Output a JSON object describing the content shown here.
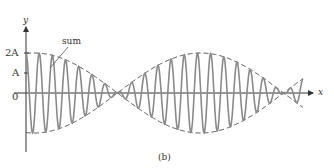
{
  "figure": {
    "caption": "(b)",
    "axis_labels": {
      "y": "y",
      "x": "x"
    },
    "tick_labels": {
      "two_a": "2A",
      "a": "A",
      "zero": "0"
    },
    "annotation": "sum",
    "colors": {
      "wave": "#8a8a8a",
      "envelope": "#444444",
      "axis": "#333333"
    }
  },
  "chart_data": {
    "type": "line",
    "title": "",
    "xlabel": "x",
    "ylabel": "y",
    "yticks": [
      "2A",
      "A",
      "0"
    ],
    "series": [
      {
        "name": "sum",
        "style": "solid",
        "amplitude_max": "2A"
      },
      {
        "name": "envelope",
        "style": "dashed"
      }
    ],
    "envelope_nodes_x_fraction": [
      0.33,
      0.93
    ],
    "caption": "(b)"
  }
}
